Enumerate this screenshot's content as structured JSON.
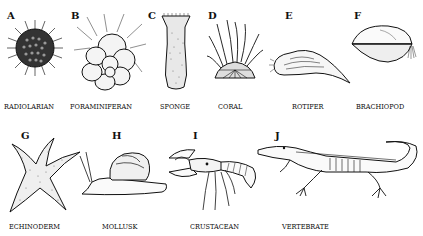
{
  "figure": {
    "panels": [
      {
        "letter": "A",
        "caption": "RADIOLARIAN",
        "icon": "radiolarian-icon"
      },
      {
        "letter": "B",
        "caption": "FORAMINIFERAN",
        "icon": "foraminiferan-icon"
      },
      {
        "letter": "C",
        "caption": "SPONGE",
        "icon": "sponge-icon"
      },
      {
        "letter": "D",
        "caption": "CORAL",
        "icon": "coral-icon"
      },
      {
        "letter": "E",
        "caption": "ROTIFER",
        "icon": "rotifer-icon"
      },
      {
        "letter": "F",
        "caption": "BRACHIOPOD",
        "icon": "brachiopod-icon"
      },
      {
        "letter": "G",
        "caption": "ECHINODERM",
        "icon": "starfish-icon"
      },
      {
        "letter": "H",
        "caption": "MOLLUSK",
        "icon": "snail-icon"
      },
      {
        "letter": "I",
        "caption": "CRUSTACEAN",
        "icon": "crayfish-icon"
      },
      {
        "letter": "J",
        "caption": "VERTEBRATE",
        "icon": "crocodile-skeleton-icon"
      }
    ]
  }
}
